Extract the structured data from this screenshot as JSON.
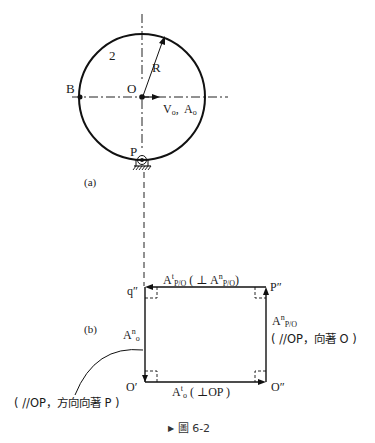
{
  "figure": {
    "caption_marker": "▶",
    "caption": "圖 6-2"
  },
  "part_a": {
    "panel_label": "(a)",
    "body_number": "2",
    "radius_label": "R",
    "center_label": "O",
    "left_point_label": "B",
    "contact_point_label": "P",
    "center_motion_label": "V",
    "center_motion_sub": "o",
    "center_motion_sep": ",  ",
    "center_accel_label": "A",
    "center_accel_sub": "o"
  },
  "part_b": {
    "panel_label": "(b)",
    "corners": {
      "top_left": "q″",
      "top_right": "P″",
      "bottom_left": "O′",
      "bottom_right": "O″"
    },
    "top_vector": {
      "symbol": "A",
      "sup": "t",
      "sub": "P/O",
      "note_open": " ( ⊥ A",
      "note_sup": "n",
      "note_sub": "P/O",
      "note_close": ")"
    },
    "right_vector": {
      "symbol": "A",
      "sup": "n",
      "sub": "P/O",
      "note": "( //OP，向著 O )"
    },
    "bottom_vector": {
      "symbol": "A",
      "sup": "t",
      "sub": "o",
      "note": " ( ⊥OP )"
    },
    "left_vector": {
      "symbol": "A",
      "sup": "n",
      "sub": "o",
      "note": "( //OP，方向向著 P )"
    }
  }
}
